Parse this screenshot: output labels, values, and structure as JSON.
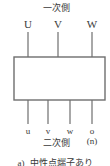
{
  "figure": {
    "primary_side_label": "一次側",
    "secondary_side_label": "二次側",
    "caption_letter": "a)",
    "caption_text": "中性点端子あり",
    "line_color": "#6e6e6e",
    "text_color": "#3a3a3a",
    "background_color": "#ffffff",
    "box": {
      "x": 14,
      "y": 57,
      "width": 91,
      "height": 43
    },
    "primary_terminals": [
      {
        "label": "U",
        "x": 28,
        "line_top": 32,
        "line_bottom": 57
      },
      {
        "label": "V",
        "x": 58,
        "line_top": 32,
        "line_bottom": 57
      },
      {
        "label": "W",
        "x": 92,
        "line_top": 32,
        "line_bottom": 57
      }
    ],
    "secondary_terminals": [
      {
        "label": "u",
        "x": 28,
        "line_top": 100,
        "line_bottom": 124
      },
      {
        "label": "v",
        "x": 48,
        "line_top": 100,
        "line_bottom": 124
      },
      {
        "label": "w",
        "x": 70,
        "line_top": 100,
        "line_bottom": 124
      },
      {
        "label": "o",
        "sublabel": "(n)",
        "x": 92,
        "line_top": 100,
        "line_bottom": 124
      }
    ]
  }
}
